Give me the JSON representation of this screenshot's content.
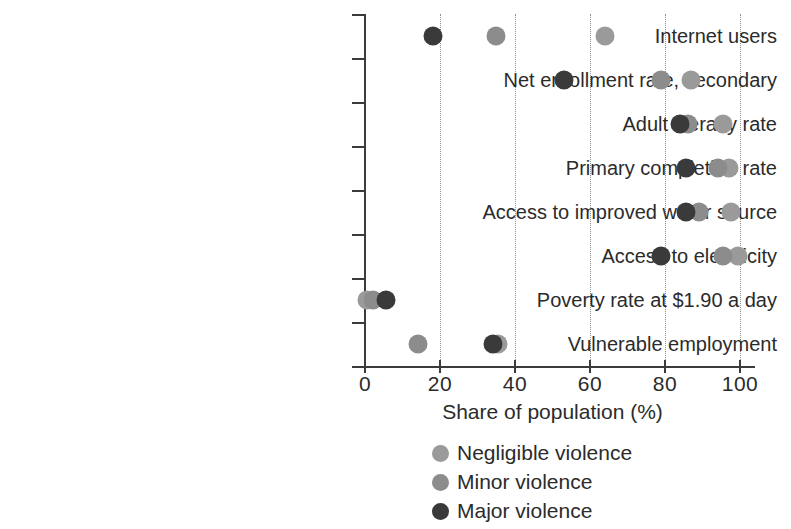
{
  "chart_data": {
    "type": "scatter",
    "title": "",
    "xlabel": "Share of population (%)",
    "ylabel": "",
    "xlim": [
      0,
      100
    ],
    "xticks": [
      0,
      20,
      40,
      60,
      80,
      100
    ],
    "grid": "vertical dotted at x ticks",
    "legend_position": "bottom-center",
    "orientation": "horizontal dot plot",
    "categories": [
      "Internet users",
      "Net enrollment rate, secondary",
      "Adult literacy rate",
      "Primary completion rate",
      "Access to improved water source",
      "Access to electricity",
      "Poverty rate at $1.90 a day",
      "Vulnerable employment"
    ],
    "series": [
      {
        "name": "Negligible violence",
        "color": "#9a9a9a",
        "values": [
          64,
          87,
          95.5,
          97,
          97.5,
          99.5,
          0.5,
          35.5
        ]
      },
      {
        "name": "Minor violence",
        "color": "#8c8c8c",
        "values": [
          35,
          79,
          86,
          94,
          89,
          95.5,
          2,
          14
        ]
      },
      {
        "name": "Major violence",
        "color": "#3a3a3a",
        "values": [
          18,
          53,
          84,
          85.5,
          85.5,
          79,
          5.5,
          34
        ]
      }
    ]
  },
  "axis": {
    "x_tick_labels": [
      "0",
      "20",
      "40",
      "60",
      "80",
      "100"
    ],
    "x_title": "Share of population (%)"
  },
  "legend": {
    "items": [
      {
        "label": "Negligible violence",
        "color": "#9a9a9a"
      },
      {
        "label": "Minor violence",
        "color": "#8c8c8c"
      },
      {
        "label": "Major violence",
        "color": "#3a3a3a"
      }
    ]
  }
}
